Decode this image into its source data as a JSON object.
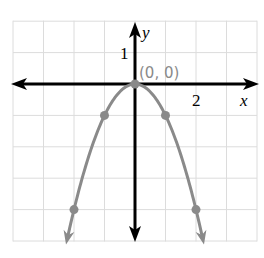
{
  "chart_data": {
    "type": "line",
    "title": "",
    "xlabel": "x",
    "ylabel": "y",
    "xlim": [
      -4,
      4
    ],
    "ylim": [
      -5,
      2
    ],
    "grid": true,
    "tick_labels": {
      "x": [
        {
          "value": 2,
          "label": "2"
        }
      ],
      "y": [
        {
          "value": 1,
          "label": "1"
        }
      ]
    },
    "series": [
      {
        "name": "y = -x^2",
        "function": "-x^2",
        "color": "#8a8a8a",
        "points": [
          {
            "x": -2,
            "y": -4
          },
          {
            "x": -1,
            "y": -1
          },
          {
            "x": 0,
            "y": 0
          },
          {
            "x": 1,
            "y": -1
          },
          {
            "x": 2,
            "y": -4
          }
        ],
        "arrows_at_ends": true
      }
    ],
    "annotations": [
      {
        "text": "(0, 0)",
        "x": 0,
        "y": 0,
        "color": "#8a8a8a"
      }
    ]
  },
  "labels": {
    "x_axis": "x",
    "y_axis": "y",
    "x_tick": "2",
    "y_tick": "1",
    "vertex": "(0, 0)"
  },
  "colors": {
    "grid": "#dcdcdc",
    "axes": "#000000",
    "curve": "#8a8a8a"
  }
}
